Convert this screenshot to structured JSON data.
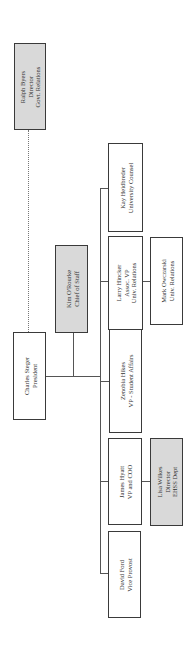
{
  "chart": {
    "nodes": {
      "ralph": {
        "name": "Ralph Byers",
        "title": "Director",
        "dept": "Govt. Relations",
        "shaded": true
      },
      "charles": {
        "name": "Charles Steger",
        "title": "President",
        "shaded": false
      },
      "kim": {
        "name": "Kim O'Rourke",
        "title": "Chief of Staff",
        "shaded": true
      },
      "kay": {
        "name": "Kay Heidbreder",
        "title": "University Counsel",
        "shaded": false
      },
      "larry": {
        "name": "Larry Hincker",
        "title": "Assoc. VP",
        "dept": "Univ. Relations",
        "shaded": false
      },
      "mark": {
        "name": "Mark Owczarski",
        "title": "Univ. Relations",
        "shaded": false
      },
      "zenobia": {
        "name": "Zenobia Hikes",
        "title": "VP - Student Affairs",
        "shaded": false
      },
      "james": {
        "name": "James Hyatt",
        "title": "VP and COO",
        "shaded": false
      },
      "lisa": {
        "name": "Lisa Wilkes",
        "title": "Director",
        "dept": "EHSS Dept",
        "shaded": true
      },
      "david": {
        "name": "David Ford",
        "title": "Vice Provost",
        "shaded": false
      }
    },
    "colors": {
      "border": "#3a3a3a",
      "shaded_fill": "#d9d9d9",
      "line": "#555555"
    }
  }
}
